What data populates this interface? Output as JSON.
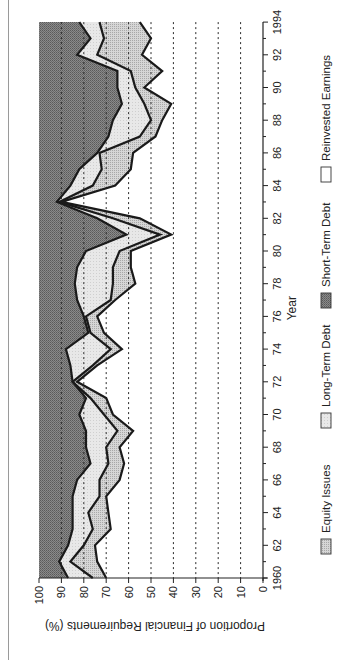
{
  "chart_data": {
    "type": "area",
    "stacked": true,
    "orientation_note": "figure rotated 90 degrees counter-clockwise on the page",
    "title": "",
    "xlabel": "Year",
    "ylabel": "Proportion of Financial Requirements (%)",
    "ylim": [
      0,
      100
    ],
    "xlim": [
      1960,
      1994
    ],
    "x_tick_labels": [
      "1960",
      "62",
      "64",
      "66",
      "68",
      "70",
      "72",
      "74",
      "76",
      "78",
      "80",
      "82",
      "84",
      "86",
      "88",
      "90",
      "92",
      "1994"
    ],
    "y_tick_labels": [
      "0",
      "10",
      "20",
      "30",
      "40",
      "50",
      "60",
      "70",
      "80",
      "90",
      "100"
    ],
    "grid": "dashed lines at every 10%",
    "legend": [
      "Equity Issues",
      "Long-Term Debt",
      "Short-Term Debt",
      "Reinvested Earnings"
    ],
    "legend_position": "below x-axis",
    "x": [
      1960,
      1961,
      1962,
      1963,
      1964,
      1965,
      1966,
      1967,
      1968,
      1969,
      1970,
      1971,
      1972,
      1973,
      1974,
      1975,
      1976,
      1977,
      1978,
      1979,
      1980,
      1981,
      1982,
      1983,
      1984,
      1985,
      1986,
      1987,
      1988,
      1989,
      1990,
      1991,
      1992,
      1993,
      1994
    ],
    "series": [
      {
        "name": "Reinvested Earnings",
        "fill": "#ffffff",
        "values": [
          70,
          74,
          75,
          68,
          69,
          70,
          64,
          62,
          64,
          58,
          67,
          70,
          83,
          74,
          63,
          71,
          74,
          66,
          57,
          59,
          59,
          41,
          55,
          90,
          66,
          59,
          58,
          48,
          45,
          41,
          53,
          45,
          54,
          50,
          55
        ]
      },
      {
        "name": "Equity Issues",
        "fill": "#c4c4c4",
        "values": [
          6,
          12,
          5,
          8,
          9,
          3,
          9,
          7,
          6,
          7,
          4,
          7,
          2,
          2,
          5,
          6,
          5,
          2,
          10,
          8,
          5,
          5,
          12,
          1,
          10,
          13,
          15,
          7,
          5,
          12,
          4,
          14,
          20,
          21,
          18
        ]
      },
      {
        "name": "Long-Term Debt",
        "fill": "#e2e2e2",
        "values": [
          11,
          5,
          7,
          9,
          7,
          12,
          10,
          8,
          9,
          14,
          11,
          2,
          0,
          10,
          20,
          1,
          1,
          15,
          17,
          16,
          15,
          15,
          7,
          1,
          10,
          10,
          1,
          14,
          17,
          10,
          8,
          6,
          9,
          6,
          9
        ]
      },
      {
        "name": "Short-Term Debt",
        "fill": "#7e7e7e",
        "values": [
          13,
          9,
          13,
          15,
          15,
          15,
          17,
          23,
          21,
          21,
          18,
          21,
          15,
          14,
          12,
          22,
          20,
          17,
          16,
          17,
          21,
          39,
          26,
          8,
          14,
          18,
          26,
          31,
          33,
          37,
          35,
          35,
          17,
          23,
          18
        ]
      }
    ]
  },
  "axes": {
    "x_label": "Year",
    "y_label": "Proportion of Financial Requirements (%)"
  },
  "legend": {
    "items": [
      {
        "label": "Equity Issues",
        "swatch": "medium-dotted"
      },
      {
        "label": "Long-Term Debt",
        "swatch": "light"
      },
      {
        "label": "Short-Term Debt",
        "swatch": "dark"
      },
      {
        "label": "Reinvested Earnings",
        "swatch": "white"
      }
    ]
  },
  "colors": {
    "short_term": "#7e7e7e",
    "long_term": "#e2e2e2",
    "equity": "#c4c4c4",
    "reinvested": "#ffffff",
    "line": "#1a1a1a",
    "grid": "#333333"
  }
}
